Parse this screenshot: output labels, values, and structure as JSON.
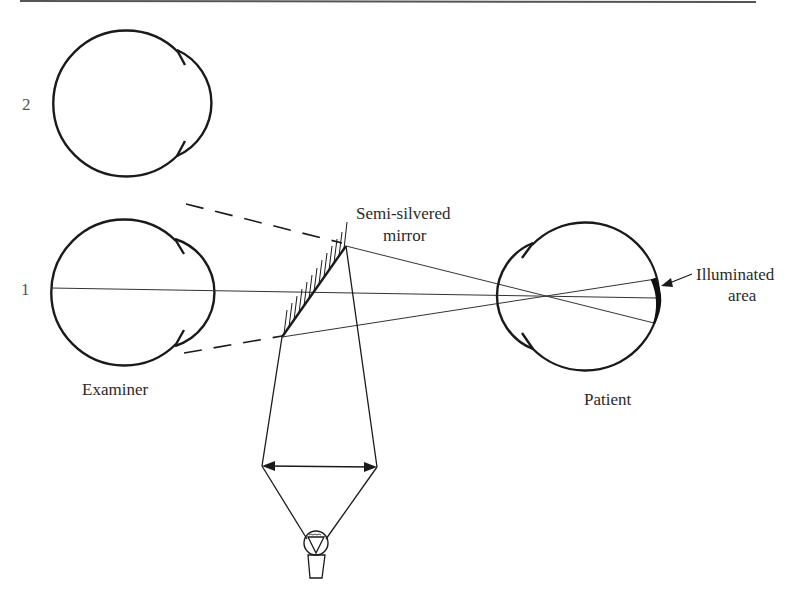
{
  "diagram": {
    "labels": {
      "position_2": "2",
      "position_1": "1",
      "examiner": "Examiner",
      "patient": "Patient",
      "mirror_line1": "Semi-silvered",
      "mirror_line2": "mirror",
      "illuminated_line1": "Illuminated",
      "illuminated_line2": "area"
    },
    "components": [
      {
        "id": "examiner-eye-position-2",
        "type": "eye",
        "facing": "right"
      },
      {
        "id": "examiner-eye-position-1",
        "type": "eye",
        "facing": "right"
      },
      {
        "id": "semi-silvered-mirror",
        "type": "mirror"
      },
      {
        "id": "condensing-lens",
        "type": "lens"
      },
      {
        "id": "light-bulb",
        "type": "light-source"
      },
      {
        "id": "patient-eye",
        "type": "eye",
        "facing": "left"
      },
      {
        "id": "illuminated-area",
        "type": "retina-highlight"
      }
    ],
    "colors": {
      "line": "#1a1a1a",
      "background": "#ffffff"
    }
  }
}
